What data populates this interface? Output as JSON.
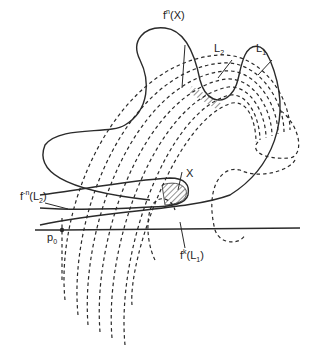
{
  "diagram": {
    "type": "homoclinic-tangle",
    "labels": {
      "fn_x": {
        "base": "f",
        "sup": "n",
        "arg": "(X)"
      },
      "l2": {
        "base": "L",
        "sub": "2"
      },
      "l1": {
        "base": "L",
        "sub": "1"
      },
      "x": "X",
      "f_minus_n_l2": {
        "base": "f",
        "sup": "-n",
        "arg_open": "(L",
        "arg_sub": "2",
        "arg_close": ")"
      },
      "p0": {
        "base": "p",
        "sub": "0"
      },
      "fk_l1": {
        "base": "f",
        "sup": "k",
        "arg_open": "(L",
        "arg_sub": "1",
        "arg_close": ")"
      }
    },
    "colors": {
      "stroke": "#2a2a2a",
      "background": "#ffffff"
    }
  }
}
